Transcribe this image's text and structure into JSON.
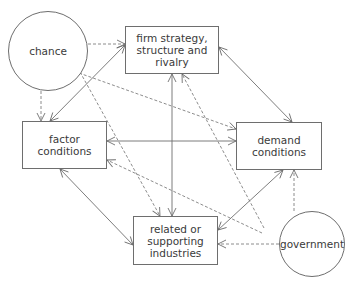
{
  "diagram": {
    "nodes": {
      "chance": {
        "label": "chance"
      },
      "firm": {
        "label": "firm strategy,\nstructure and\nrivalry"
      },
      "factor": {
        "label": "factor\nconditions"
      },
      "demand": {
        "label": "demand\nconditions"
      },
      "related": {
        "label": "related or\nsupporting\nindustries"
      },
      "government": {
        "label": "government"
      }
    },
    "edges": [
      {
        "from": "firm",
        "to": "factor",
        "style": "solid",
        "direction": "both"
      },
      {
        "from": "firm",
        "to": "demand",
        "style": "solid",
        "direction": "both"
      },
      {
        "from": "firm",
        "to": "related",
        "style": "solid",
        "direction": "both"
      },
      {
        "from": "factor",
        "to": "demand",
        "style": "solid",
        "direction": "both"
      },
      {
        "from": "factor",
        "to": "related",
        "style": "solid",
        "direction": "both"
      },
      {
        "from": "demand",
        "to": "related",
        "style": "solid",
        "direction": "both"
      },
      {
        "from": "chance",
        "to": "firm",
        "style": "dashed",
        "direction": "forward"
      },
      {
        "from": "chance",
        "to": "factor",
        "style": "dashed",
        "direction": "forward"
      },
      {
        "from": "chance",
        "to": "demand",
        "style": "dashed",
        "direction": "forward"
      },
      {
        "from": "chance",
        "to": "related",
        "style": "dashed",
        "direction": "forward"
      },
      {
        "from": "government",
        "to": "firm",
        "style": "dashed",
        "direction": "forward"
      },
      {
        "from": "government",
        "to": "factor",
        "style": "dashed",
        "direction": "forward"
      },
      {
        "from": "government",
        "to": "demand",
        "style": "dashed",
        "direction": "forward"
      },
      {
        "from": "government",
        "to": "related",
        "style": "dashed",
        "direction": "forward"
      }
    ],
    "colors": {
      "line": "#6e6e6e",
      "text": "#3a3a3a",
      "background": "#ffffff"
    }
  }
}
